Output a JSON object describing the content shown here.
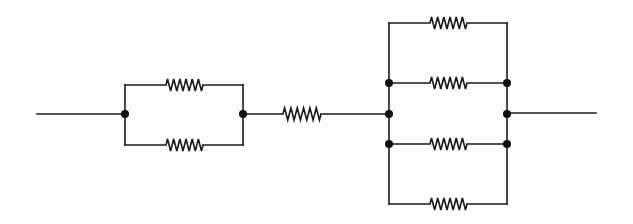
{
  "diagram": {
    "type": "resistor-network",
    "colors": {
      "line": "#1a1a1a",
      "node": "#0d0d0d",
      "background": "#ffffff"
    },
    "lead_in": {
      "x1": 37,
      "x2": 125,
      "y": 114
    },
    "block_a": {
      "description": "two resistors in parallel",
      "left_node": {
        "x": 125,
        "y": 114
      },
      "right_node": {
        "x": 243,
        "y": 114
      },
      "branches": [
        {
          "y": 85,
          "resistor": {
            "x1": 166,
            "x2": 203
          }
        },
        {
          "y": 145,
          "resistor": {
            "x1": 166,
            "x2": 203
          }
        }
      ]
    },
    "series_resistor": {
      "x1": 283,
      "x2": 321,
      "y": 114
    },
    "block_b": {
      "description": "four resistors in parallel",
      "left_x": 389,
      "right_x": 507,
      "mid_node_y": 114,
      "branches": [
        {
          "y": 23,
          "resistor": {
            "x1": 430,
            "x2": 467
          },
          "nodes": false
        },
        {
          "y": 83,
          "resistor": {
            "x1": 430,
            "x2": 467
          },
          "nodes": true
        },
        {
          "y": 144,
          "resistor": {
            "x1": 430,
            "x2": 467
          },
          "nodes": true
        },
        {
          "y": 204,
          "resistor": {
            "x1": 430,
            "x2": 467
          },
          "nodes": false
        }
      ]
    },
    "lead_out": {
      "x1": 507,
      "x2": 596,
      "y": 113
    },
    "resistor_count": 7,
    "node_count": 8
  }
}
